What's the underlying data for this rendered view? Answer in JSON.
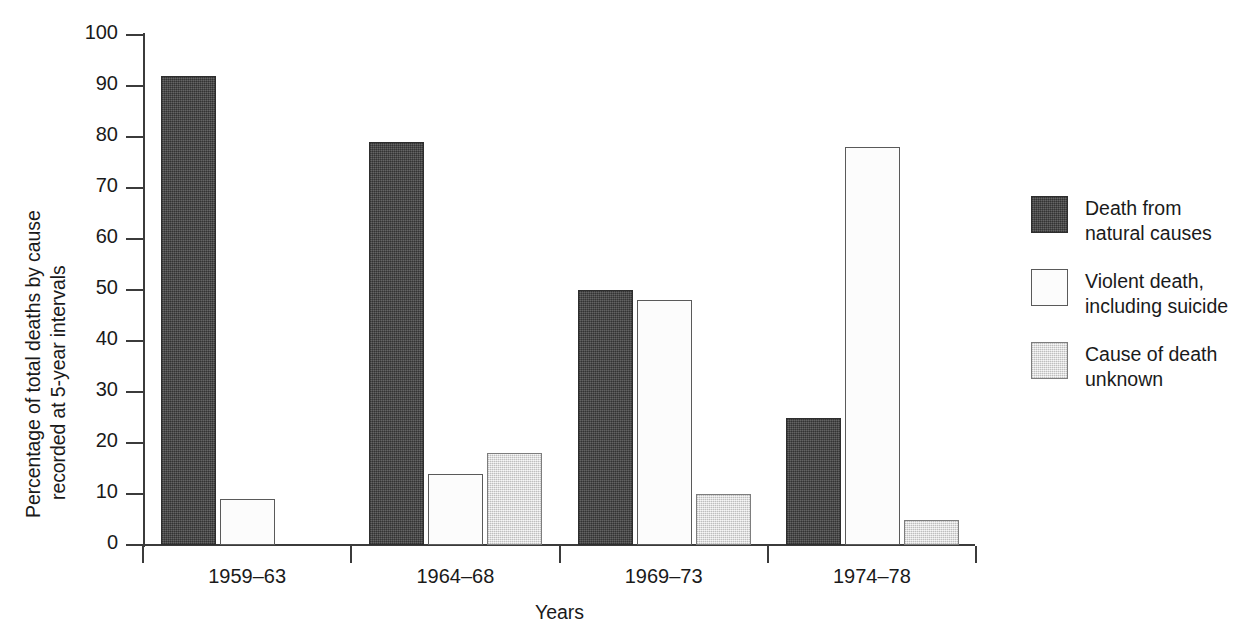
{
  "chart_data": {
    "type": "bar",
    "title": "",
    "xlabel": "Years",
    "ylabel": "Percentage of total deaths by cause recorded at 5-year intervals",
    "ylabel_lines": [
      "Percentage of total deaths by cause",
      "recorded at 5-year intervals"
    ],
    "categories": [
      "1959–63",
      "1964–68",
      "1969–73",
      "1974–78"
    ],
    "series": [
      {
        "name": "Death from natural causes",
        "name_lines": [
          "Death from",
          "natural causes"
        ],
        "swatch": "dark",
        "color": "#4c4c4c",
        "values": [
          92,
          79,
          50,
          25
        ]
      },
      {
        "name": "Violent death, including suicide",
        "name_lines": [
          "Violent death,",
          "including suicide"
        ],
        "swatch": "white",
        "color": "#fcfcfc",
        "values": [
          9,
          14,
          48,
          78
        ]
      },
      {
        "name": "Cause of death unknown",
        "name_lines": [
          "Cause of death",
          "unknown"
        ],
        "swatch": "light",
        "color": "#dcdcdc",
        "values": [
          null,
          18,
          10,
          5
        ]
      }
    ],
    "ylim": [
      0,
      100
    ],
    "yticks": [
      0,
      10,
      20,
      30,
      40,
      50,
      60,
      70,
      80,
      90,
      100
    ],
    "ytick_labels": [
      "0",
      "10",
      "20",
      "30",
      "40",
      "50",
      "60",
      "70",
      "80",
      "90",
      "100"
    ],
    "grid": false,
    "legend_position": "right"
  },
  "axis": {
    "y_title_line1": "Percentage of total deaths by cause",
    "y_title_line2": "recorded at 5-year intervals",
    "x_title": "Years"
  },
  "legend": {
    "items": [
      {
        "swatch": "dark",
        "line1": "Death from",
        "line2": "natural causes"
      },
      {
        "swatch": "white",
        "line1": "Violent death,",
        "line2": "including suicide"
      },
      {
        "swatch": "light",
        "line1": "Cause of death",
        "line2": "unknown"
      }
    ]
  }
}
